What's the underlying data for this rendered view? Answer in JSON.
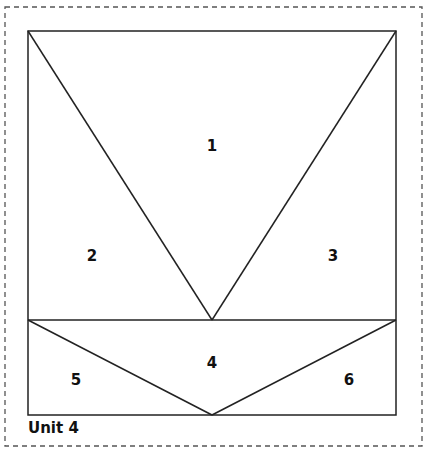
{
  "title": "Unit 4",
  "colors": {
    "line": "#222222",
    "dash": "#555555",
    "background": "#ffffff"
  },
  "pieces": [
    {
      "id": "1",
      "label": "1",
      "shape": "triangle",
      "points": [
        [
          28,
          31
        ],
        [
          396,
          31
        ],
        [
          212,
          320
        ]
      ],
      "label_pos": [
        212,
        146
      ]
    },
    {
      "id": "2",
      "label": "2",
      "shape": "triangle",
      "points": [
        [
          28,
          31
        ],
        [
          212,
          320
        ],
        [
          28,
          320
        ]
      ],
      "label_pos": [
        92,
        256
      ]
    },
    {
      "id": "3",
      "label": "3",
      "shape": "triangle",
      "points": [
        [
          396,
          31
        ],
        [
          396,
          320
        ],
        [
          212,
          320
        ]
      ],
      "label_pos": [
        333,
        256
      ]
    },
    {
      "id": "4",
      "label": "4",
      "shape": "triangle",
      "points": [
        [
          28,
          320
        ],
        [
          396,
          320
        ],
        [
          212,
          415
        ]
      ],
      "label_pos": [
        212,
        363
      ]
    },
    {
      "id": "5",
      "label": "5",
      "shape": "triangle",
      "points": [
        [
          28,
          320
        ],
        [
          212,
          415
        ],
        [
          28,
          415
        ]
      ],
      "label_pos": [
        76,
        380
      ]
    },
    {
      "id": "6",
      "label": "6",
      "shape": "triangle",
      "points": [
        [
          396,
          320
        ],
        [
          396,
          415
        ],
        [
          212,
          415
        ]
      ],
      "label_pos": [
        349,
        380
      ]
    }
  ]
}
